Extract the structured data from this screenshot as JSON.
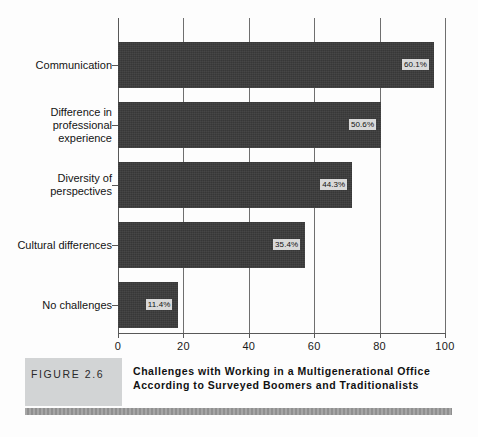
{
  "figure": {
    "tag": "FIGURE 2.6",
    "caption": "Challenges with Working in a Multigenerational Office According to Surveyed Boomers and Traditionalists"
  },
  "chart_data": {
    "type": "bar",
    "orientation": "horizontal",
    "title": "Challenges with Working in a Multigenerational Office According to Surveyed Boomers and Traditionalists",
    "xlabel": "",
    "ylabel": "",
    "xlim": [
      0,
      100
    ],
    "xticks": [
      "0",
      "20",
      "40",
      "60",
      "80",
      "100"
    ],
    "grid": true,
    "legend": "none",
    "bar_color": "#3a3a3a",
    "label_background": "#d9d9d9",
    "categories": [
      "Communication",
      "Difference in\nprofessional\nexperience",
      "Diversity of\nperspectives",
      "Cultural differences",
      "No challenges"
    ],
    "values": [
      60.1,
      50.6,
      44.3,
      35.4,
      11.4
    ],
    "data_labels": [
      "60.1%",
      "50.6%",
      "44.3%",
      "35.4%",
      "11.4%"
    ],
    "drawn_bar_lengths": [
      96.6,
      80.4,
      71.6,
      57.2,
      18.3
    ]
  },
  "bars": [
    {
      "label": "Communication",
      "value_text": "60.1%",
      "length": 96.6,
      "top": 24,
      "height": 46,
      "tick_y": 47
    },
    {
      "label": "Difference in\nprofessional\nexperience",
      "value_text": "50.6%",
      "length": 80.4,
      "top": 84,
      "height": 46,
      "tick_y": 107
    },
    {
      "label": "Diversity of\nperspectives",
      "value_text": "44.3%",
      "length": 71.6,
      "top": 144,
      "height": 46,
      "tick_y": 167
    },
    {
      "label": "Cultural differences",
      "value_text": "35.4%",
      "length": 57.2,
      "top": 204,
      "height": 46,
      "tick_y": 227
    },
    {
      "label": "No challenges",
      "value_text": "11.4%",
      "length": 18.3,
      "top": 264,
      "height": 46,
      "tick_y": 287
    }
  ],
  "axis": {
    "ticks": [
      {
        "label": "0",
        "value": 0
      },
      {
        "label": "20",
        "value": 20
      },
      {
        "label": "40",
        "value": 40
      },
      {
        "label": "60",
        "value": 60
      },
      {
        "label": "80",
        "value": 80
      },
      {
        "label": "100",
        "value": 100
      }
    ]
  }
}
